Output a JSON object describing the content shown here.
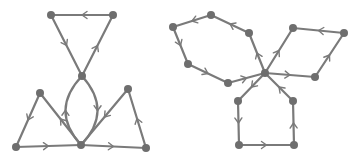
{
  "style": {
    "edge_color": "#7a7a7a",
    "node_color": "#6e6e6e",
    "background": "#ffffff",
    "node_radius": 4
  },
  "graphs": [
    {
      "name": "left-graph",
      "nodes": [
        {
          "id": "L_tl",
          "x": 51,
          "y": 15
        },
        {
          "id": "L_tr",
          "x": 113,
          "y": 15
        },
        {
          "id": "L_c",
          "x": 82,
          "y": 76
        },
        {
          "id": "L_lp",
          "x": 40,
          "y": 93
        },
        {
          "id": "L_rp",
          "x": 128,
          "y": 89
        },
        {
          "id": "L_bl",
          "x": 16,
          "y": 147
        },
        {
          "id": "L_bc",
          "x": 81,
          "y": 145
        },
        {
          "id": "L_br",
          "x": 146,
          "y": 148
        }
      ],
      "edges": [
        {
          "from": "L_tr",
          "to": "L_tl"
        },
        {
          "from": "L_tl",
          "to": "L_c"
        },
        {
          "from": "L_c",
          "to": "L_tr"
        },
        {
          "from": "L_c",
          "to": "L_bc",
          "curve": -16
        },
        {
          "from": "L_bc",
          "to": "L_c",
          "curve": -16
        },
        {
          "from": "L_lp",
          "to": "L_bl"
        },
        {
          "from": "L_bc",
          "to": "L_lp"
        },
        {
          "from": "L_bl",
          "to": "L_bc"
        },
        {
          "from": "L_bc",
          "to": "L_br"
        },
        {
          "from": "L_br",
          "to": "L_rp"
        },
        {
          "from": "L_rp",
          "to": "L_bc"
        }
      ]
    },
    {
      "name": "right-graph",
      "nodes": [
        {
          "id": "R_c",
          "x": 265,
          "y": 73
        },
        {
          "id": "R_h1",
          "x": 249,
          "y": 33
        },
        {
          "id": "R_h2",
          "x": 211,
          "y": 15
        },
        {
          "id": "R_h3",
          "x": 173,
          "y": 27
        },
        {
          "id": "R_h4",
          "x": 188,
          "y": 64
        },
        {
          "id": "R_h5",
          "x": 228,
          "y": 83
        },
        {
          "id": "R_r1",
          "x": 293,
          "y": 28
        },
        {
          "id": "R_r2",
          "x": 344,
          "y": 33
        },
        {
          "id": "R_r3",
          "x": 315,
          "y": 77
        },
        {
          "id": "R_p1",
          "x": 238,
          "y": 101
        },
        {
          "id": "R_p2",
          "x": 239,
          "y": 145
        },
        {
          "id": "R_p3",
          "x": 294,
          "y": 145
        },
        {
          "id": "R_p4",
          "x": 293,
          "y": 101
        }
      ],
      "edges": [
        {
          "from": "R_c",
          "to": "R_h1"
        },
        {
          "from": "R_h1",
          "to": "R_h2"
        },
        {
          "from": "R_h2",
          "to": "R_h3"
        },
        {
          "from": "R_h3",
          "to": "R_h4"
        },
        {
          "from": "R_h4",
          "to": "R_h5"
        },
        {
          "from": "R_h5",
          "to": "R_c"
        },
        {
          "from": "R_c",
          "to": "R_r1"
        },
        {
          "from": "R_r2",
          "to": "R_r1"
        },
        {
          "from": "R_r3",
          "to": "R_r2"
        },
        {
          "from": "R_c",
          "to": "R_r3"
        },
        {
          "from": "R_c",
          "to": "R_p1"
        },
        {
          "from": "R_p1",
          "to": "R_p2"
        },
        {
          "from": "R_p2",
          "to": "R_p3"
        },
        {
          "from": "R_p3",
          "to": "R_p4"
        },
        {
          "from": "R_p4",
          "to": "R_c"
        }
      ]
    }
  ]
}
